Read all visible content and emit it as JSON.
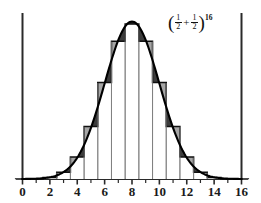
{
  "figure": {
    "annotation_open_paren": "(",
    "annotation_close_paren": ")",
    "annotation_plus": "+",
    "annotation_exponent": "16",
    "frac1_num": "1",
    "frac1_den": "2",
    "frac2_num": "1",
    "frac2_den": "2",
    "annotation_text": "(1/2 + 1/2)^16"
  },
  "chart_data": {
    "type": "bar",
    "title": "(1/2 + 1/2)^16",
    "xlabel": "",
    "ylabel": "",
    "xlim": [
      0,
      16
    ],
    "ylim": [
      0,
      0.22
    ],
    "grid": false,
    "legend": null,
    "categories": [
      "0",
      "1",
      "2",
      "3",
      "4",
      "5",
      "6",
      "7",
      "8",
      "9",
      "10",
      "11",
      "12",
      "13",
      "14",
      "15",
      "16"
    ],
    "values": [
      1.53e-05,
      0.0002441,
      0.0018311,
      0.0085449,
      0.027771,
      0.0666504,
      0.1221924,
      0.1745605,
      0.1963806,
      0.1745605,
      0.1221924,
      0.0666504,
      0.027771,
      0.0085449,
      0.0018311,
      0.0002441,
      1.53e-05
    ],
    "counts": [
      1,
      16,
      120,
      560,
      1820,
      4368,
      8008,
      11440,
      12870,
      11440,
      8008,
      4368,
      1820,
      560,
      120,
      16,
      1
    ],
    "denominator": 65536,
    "overlay": {
      "type": "line",
      "name": "normal-curve",
      "mean": 8,
      "sd": 2,
      "peak": 0.19947
    },
    "x_ticks_major": [
      "0",
      "2",
      "4",
      "6",
      "8",
      "10",
      "12",
      "14",
      "16"
    ],
    "x_ticks_minor": [
      "1",
      "3",
      "5",
      "7",
      "9",
      "11",
      "13",
      "15"
    ],
    "y_ticks": [],
    "colors": {
      "axis": "#222222",
      "bar_outline": "#111111",
      "bar_fill": "#ffffff",
      "curve": "#000000",
      "shade": "#2b2b2b",
      "background": "#ffffff"
    }
  },
  "x_axis": {
    "labels": [
      {
        "text": "0",
        "value": 0
      },
      {
        "text": "2",
        "value": 2
      },
      {
        "text": "4",
        "value": 4
      },
      {
        "text": "6",
        "value": 6
      },
      {
        "text": "8",
        "value": 8
      },
      {
        "text": "10",
        "value": 10
      },
      {
        "text": "12",
        "value": 12
      },
      {
        "text": "14",
        "value": 14
      },
      {
        "text": "16",
        "value": 16
      }
    ]
  }
}
